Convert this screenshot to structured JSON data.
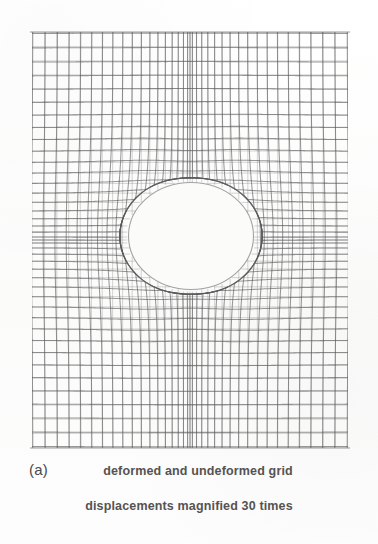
{
  "figure": {
    "panel_label": "(a)",
    "caption_line_1": "deformed and undeformed grid",
    "caption_line_2": "displacements magnified 30 times",
    "background_color": "#fcfcfc",
    "line_color": "#5a5a5a",
    "hole_fill_color": "#fbfbfa"
  },
  "chart_data": {
    "type": "mesh",
    "title": "deformed and undeformed grid",
    "subtitle": "displacements magnified 30 times",
    "panel": "(a)",
    "magnification_factor": 30,
    "plate": {
      "x_min": 32,
      "x_max": 348,
      "y_min": 32,
      "y_max": 448,
      "width": 316,
      "height": 416
    },
    "hole": {
      "center_x": 191,
      "center_y": 236,
      "radius_x": 64,
      "radius_y": 55,
      "shape": "circular"
    },
    "grid": {
      "n_vertical_lines": 37,
      "n_horizontal_lines": 41,
      "spacing": "graded - finer near the hole, coarser toward the outer boundary",
      "grid_on": true,
      "legend": "none"
    },
    "xlabel": "",
    "ylabel": "",
    "xlim": [
      32,
      348
    ],
    "ylim": [
      32,
      448
    ]
  }
}
